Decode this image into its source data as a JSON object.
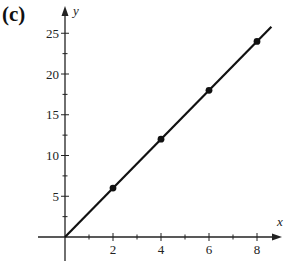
{
  "panel_label": "(c)",
  "chart_data": {
    "type": "line",
    "title": "",
    "xlabel": "x",
    "ylabel": "y",
    "x_ticks": [
      2,
      4,
      6,
      8
    ],
    "y_ticks": [
      5,
      10,
      15,
      20,
      25
    ],
    "xlim": [
      -1,
      9
    ],
    "ylim": [
      -2,
      27
    ],
    "grid": false,
    "series": [
      {
        "name": "y = 3x",
        "line": {
          "x": [
            0,
            8.6
          ],
          "y": [
            0,
            25.8
          ]
        },
        "points": {
          "x": [
            2,
            4,
            6,
            8
          ],
          "y": [
            6,
            12,
            18,
            24
          ]
        }
      }
    ]
  },
  "colors": {
    "line": "#111111",
    "axis": "#222222"
  }
}
